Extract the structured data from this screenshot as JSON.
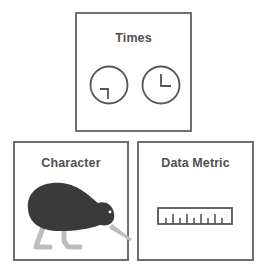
{
  "cards": {
    "times": {
      "title": "Times",
      "icons": [
        "clock-icon-left",
        "clock-icon-right"
      ]
    },
    "character": {
      "title": "Character",
      "icon": "kiwi-bird-icon"
    },
    "metric": {
      "title": "Data Metric",
      "icon": "ruler-icon"
    }
  },
  "colors": {
    "border": "#6e6e6e",
    "title": "#505050",
    "icon_stroke": "#555555",
    "kiwi_body": "#3a3a3a",
    "kiwi_legs": "#bdbdbd"
  }
}
